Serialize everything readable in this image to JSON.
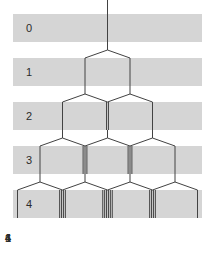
{
  "figure": {
    "row_labels": [
      "0",
      "1",
      "2",
      "3",
      "4"
    ],
    "bottom_labels": [
      "1",
      "4",
      "6",
      "4",
      "1"
    ],
    "path_counts": [
      [
        1
      ],
      [
        1,
        1
      ],
      [
        1,
        2,
        1
      ],
      [
        1,
        3,
        3,
        1
      ],
      [
        1,
        4,
        6,
        4,
        1
      ]
    ],
    "colors": {
      "background": "#ffffff",
      "band": "#d5d5d5",
      "line": "#424242",
      "label_text": "#2b2b2b"
    }
  }
}
